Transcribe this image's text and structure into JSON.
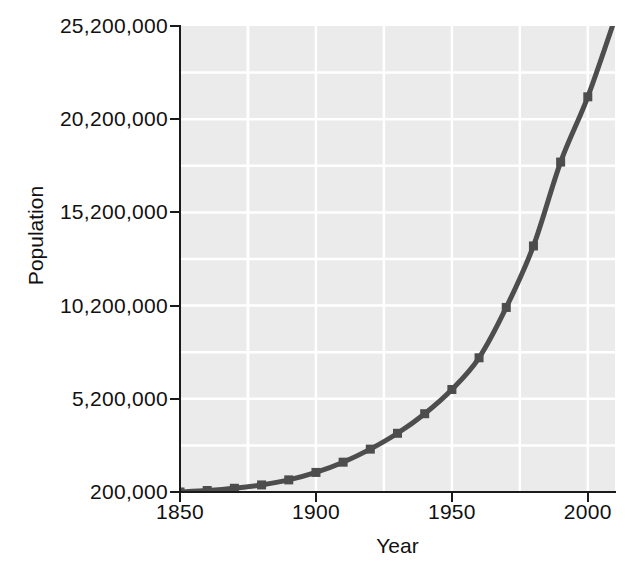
{
  "chart_data": {
    "type": "line",
    "title": "",
    "subtitle": "",
    "xlabel": "Year",
    "ylabel": "Population",
    "xlim": [
      1850,
      2010
    ],
    "ylim": [
      200000,
      25200000
    ],
    "grid": true,
    "legend": "none",
    "line_color": "#4d4d4d",
    "marker": "square",
    "marker_color": "#4d4d4d",
    "plot_background": "#ebebeb",
    "gridline_color": "#ffffff",
    "axis_color": "#1a1a1a",
    "x_ticks": [
      1850,
      1900,
      1950,
      2000
    ],
    "x_tick_labels": [
      "1850",
      "1900",
      "1950",
      "2000"
    ],
    "y_ticks": [
      200000,
      5200000,
      10200000,
      15200000,
      20200000,
      25200000
    ],
    "y_tick_labels": [
      "200,000",
      "5,200,000",
      "10,200,000",
      "15,200,000",
      "20,200,000",
      "25,200,000"
    ],
    "x": [
      1850,
      1860,
      1870,
      1880,
      1890,
      1900,
      1910,
      1920,
      1930,
      1940,
      1950,
      1960,
      1970,
      1980,
      1990,
      2000,
      2010
    ],
    "y": [
      200000,
      280000,
      400000,
      580000,
      850000,
      1250000,
      1800000,
      2500000,
      3350000,
      4400000,
      5700000,
      7400000,
      10100000,
      13400000,
      17900000,
      21400000,
      25600000
    ],
    "series": [
      {
        "name": "Population",
        "x": [
          1850,
          1860,
          1870,
          1880,
          1890,
          1900,
          1910,
          1920,
          1930,
          1940,
          1950,
          1960,
          1970,
          1980,
          1990,
          2000,
          2010
        ],
        "values": [
          200000,
          280000,
          400000,
          580000,
          850000,
          1250000,
          1800000,
          2500000,
          3350000,
          4400000,
          5700000,
          7400000,
          10100000,
          13400000,
          17900000,
          21400000,
          25600000
        ]
      }
    ]
  },
  "axes": {
    "y_title": "Population",
    "x_title": "Year"
  }
}
